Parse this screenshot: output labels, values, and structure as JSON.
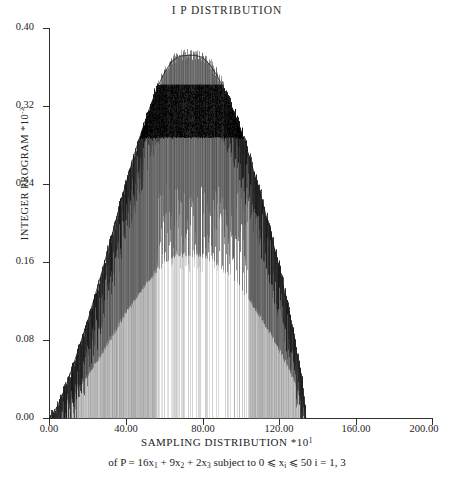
{
  "chart_data": {
    "type": "bar",
    "title": "I P DISTRIBUTION",
    "xlabel": "SAMPLING DISTRIBUTION *10",
    "xlabel_exponent": "1",
    "xlabel_subtitle_prefix": "of P = 16x",
    "ylabel": "INTEGER PROGRAM *10",
    "ylabel_exponent": "-2",
    "xlim": [
      0,
      200
    ],
    "ylim": [
      0,
      0.4
    ],
    "xticks": [
      "0.00",
      "40.00",
      "80.00",
      "120.00",
      "160.00",
      "200.00"
    ],
    "xtick_values": [
      0,
      40,
      80,
      120,
      160,
      200
    ],
    "yticks": [
      "0.00",
      "0.08",
      "0.16",
      "0.24",
      "0.32",
      "0.40"
    ],
    "ytick_values": [
      0.0,
      0.08,
      0.16,
      0.24,
      0.32,
      0.4
    ],
    "grid": false,
    "legend": "none",
    "series_name": "sampling distribution envelope",
    "x_data_start": 0,
    "x_data_end": 134,
    "plateau_x_range": [
      62,
      96
    ],
    "plateau_peak": 0.372,
    "dense_band_range": [
      0.288,
      0.342
    ],
    "hollow_center_range": [
      0.0,
      0.24
    ],
    "categories": [
      0,
      4,
      8,
      12,
      16,
      20,
      24,
      28,
      32,
      36,
      40,
      44,
      48,
      52,
      56,
      60,
      64,
      68,
      72,
      76,
      80,
      84,
      88,
      92,
      96,
      100,
      104,
      108,
      112,
      116,
      120,
      124,
      128,
      132,
      134
    ],
    "values": [
      0.0,
      0.012,
      0.03,
      0.052,
      0.076,
      0.1,
      0.127,
      0.154,
      0.183,
      0.212,
      0.241,
      0.268,
      0.293,
      0.316,
      0.337,
      0.354,
      0.366,
      0.371,
      0.372,
      0.372,
      0.37,
      0.362,
      0.35,
      0.334,
      0.316,
      0.295,
      0.271,
      0.245,
      0.217,
      0.187,
      0.155,
      0.12,
      0.081,
      0.035,
      0.0
    ]
  },
  "axis_formula": {
    "text_1": "of P = 16x",
    "sub_1": "1",
    "text_2": " + 9x",
    "sub_2": "2",
    "text_3": " + 2x",
    "sub_3": "3",
    "text_4": " subject to 0 ⩽ x",
    "sub_4": "i",
    "text_5": " ⩽ 50   i = 1, 3"
  },
  "colors": {
    "axis": "#30302f",
    "ink": "#232323",
    "spike_dark": "#111111",
    "spike_mid": "#5a5a5a",
    "spike_light": "#b4b4b4",
    "background": "#ffffff"
  }
}
